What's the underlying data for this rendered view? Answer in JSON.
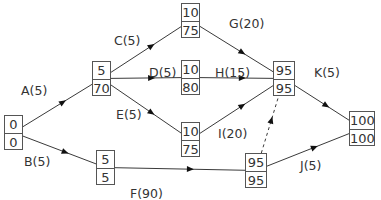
{
  "diagram": {
    "type": "activity-on-arrow network (critical path)",
    "nodes": [
      {
        "id": "n1",
        "early": "0",
        "late": "0",
        "x": 4,
        "y": 115,
        "w": 19
      },
      {
        "id": "n2",
        "early": "5",
        "late": "70",
        "x": 92,
        "y": 61,
        "w": 19
      },
      {
        "id": "n3",
        "early": "10",
        "late": "75",
        "x": 181,
        "y": 3,
        "w": 19
      },
      {
        "id": "n4",
        "early": "10",
        "late": "80",
        "x": 181,
        "y": 60,
        "w": 19
      },
      {
        "id": "n5",
        "early": "95",
        "late": "95",
        "x": 273,
        "y": 61,
        "w": 22
      },
      {
        "id": "n6",
        "early": "10",
        "late": "75",
        "x": 181,
        "y": 122,
        "w": 19
      },
      {
        "id": "n7",
        "early": "5",
        "late": "5",
        "x": 96,
        "y": 150,
        "w": 19
      },
      {
        "id": "n8",
        "early": "95",
        "late": "95",
        "x": 245,
        "y": 153,
        "w": 22
      },
      {
        "id": "n9",
        "early": "100",
        "late": "100",
        "x": 349,
        "y": 111,
        "w": 26
      }
    ],
    "activities": [
      {
        "name": "A(5)",
        "from": "n1",
        "to": "n2",
        "dashed": false,
        "lx": 21,
        "ly": 83
      },
      {
        "name": "B(5)",
        "from": "n1",
        "to": "n7",
        "dashed": false,
        "lx": 24,
        "ly": 154
      },
      {
        "name": "C(5)",
        "from": "n2",
        "to": "n3",
        "dashed": false,
        "lx": 114,
        "ly": 33
      },
      {
        "name": "D(5)",
        "from": "n2",
        "to": "n4",
        "dashed": false,
        "lx": 149,
        "ly": 65
      },
      {
        "name": "E(5)",
        "from": "n2",
        "to": "n6",
        "dashed": false,
        "lx": 116,
        "ly": 107
      },
      {
        "name": "F(90)",
        "from": "n7",
        "to": "n8",
        "dashed": false,
        "lx": 130,
        "ly": 186
      },
      {
        "name": "G(20)",
        "from": "n3",
        "to": "n5",
        "dashed": false,
        "lx": 229,
        "ly": 16
      },
      {
        "name": "H(15)",
        "from": "n4",
        "to": "n5",
        "dashed": false,
        "lx": 215,
        "ly": 65
      },
      {
        "name": "I(20)",
        "from": "n6",
        "to": "n5",
        "dashed": false,
        "lx": 218,
        "ly": 126
      },
      {
        "name": "dummy",
        "from": "n8",
        "to": "n5",
        "dashed": true,
        "lx": null,
        "ly": null
      },
      {
        "name": "K(5)",
        "from": "n5",
        "to": "n9",
        "dashed": false,
        "lx": 314,
        "ly": 65
      },
      {
        "name": "J(5)",
        "from": "n8",
        "to": "n9",
        "dashed": false,
        "lx": 300,
        "ly": 158
      }
    ]
  },
  "colors": {
    "line": "#3a3a3a",
    "box_border": "#555555",
    "text": "#333333",
    "background": "#ffffff"
  }
}
